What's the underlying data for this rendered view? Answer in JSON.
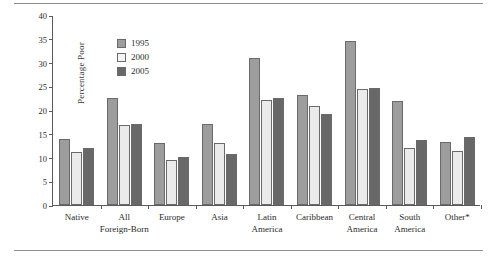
{
  "figure": {
    "y_axis_title": "Percentage Poor",
    "rule_top": "horizontal-rule",
    "rule_bottom": "horizontal-rule"
  },
  "legend": {
    "position": "top-left-inside",
    "items": [
      {
        "label": "1995",
        "color": "#9d9d9d",
        "key": "s1995"
      },
      {
        "label": "2000",
        "color": "#ebebeb",
        "key": "s2000"
      },
      {
        "label": "2005",
        "color": "#686868",
        "key": "s2005"
      }
    ]
  },
  "chart_data": {
    "type": "bar",
    "title": "",
    "xlabel": "",
    "ylabel": "Percentage Poor",
    "ylim": [
      0,
      40
    ],
    "yticks": [
      0,
      5,
      10,
      15,
      20,
      25,
      30,
      35,
      40
    ],
    "grid": false,
    "categories": [
      "Native",
      "All Foreign-Born",
      "Europe",
      "Asia",
      "Latin America",
      "Caribbean",
      "Central America",
      "South America",
      "Other*"
    ],
    "category_lines": [
      [
        "Native",
        ""
      ],
      [
        "All",
        "Foreign-Born"
      ],
      [
        "Europe",
        ""
      ],
      [
        "Asia",
        ""
      ],
      [
        "Latin",
        "America"
      ],
      [
        "Caribbean",
        ""
      ],
      [
        "Central",
        "America"
      ],
      [
        "South",
        "America"
      ],
      [
        "Other*",
        ""
      ]
    ],
    "series": [
      {
        "name": "1995",
        "color": "#9d9d9d",
        "values": [
          13.8,
          22.5,
          13.1,
          17.1,
          31.0,
          23.2,
          34.5,
          21.8,
          13.3
        ]
      },
      {
        "name": "2000",
        "color": "#ebebeb",
        "values": [
          11.2,
          16.8,
          9.4,
          13.0,
          22.1,
          20.8,
          24.4,
          11.9,
          11.3
        ]
      },
      {
        "name": "2005",
        "color": "#686868",
        "values": [
          12.1,
          17.1,
          10.2,
          10.8,
          22.5,
          19.1,
          24.7,
          13.6,
          14.4
        ]
      }
    ]
  }
}
